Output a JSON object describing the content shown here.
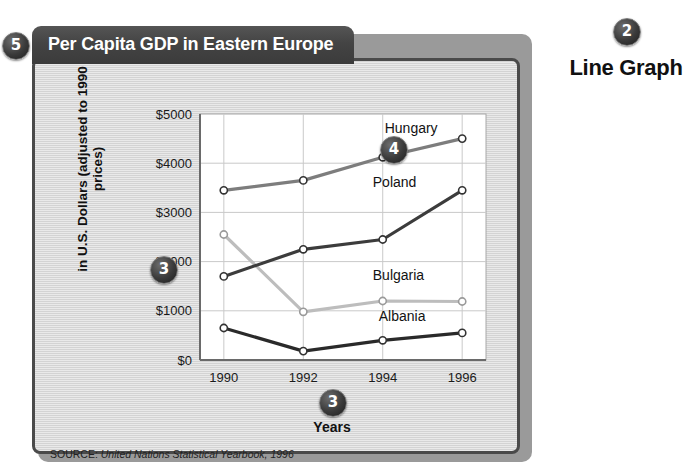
{
  "annotations": {
    "badge_5": "5",
    "badge_2": "2",
    "badge_4": "4",
    "badge_3a": "3",
    "badge_3b": "3"
  },
  "caption": {
    "line_graph": "Line Graph"
  },
  "card": {
    "title": "Per Capita GDP in Eastern Europe",
    "source_label": "SOURCE:",
    "source_reference": "United Nations Statistical Yearbook, 1996"
  },
  "chart_data": {
    "type": "line",
    "title": "Per Capita GDP in Eastern Europe",
    "xlabel": "Years",
    "ylabel": "in U.S. Dollars (adjusted to 1990 prices)",
    "x": [
      1990,
      1992,
      1994,
      1996
    ],
    "xtick_labels": [
      "1990",
      "1992",
      "1994",
      "1996"
    ],
    "ytick_labels": [
      "$0",
      "$1000",
      "$2000",
      "$3000",
      "$4000",
      "$5000"
    ],
    "yticks": [
      0,
      1000,
      2000,
      3000,
      4000,
      5000
    ],
    "ylim": [
      0,
      5000
    ],
    "xlim": [
      1989.4,
      1996.6
    ],
    "grid": true,
    "legend": "inline-labels",
    "markers": "open-circle",
    "series": [
      {
        "name": "Hungary",
        "color": "#7d7d7d",
        "values": [
          3450,
          3650,
          4120,
          4500
        ],
        "label_x": 1994.05,
        "label_y": 4620
      },
      {
        "name": "Poland",
        "color": "#3c3c3c",
        "values": [
          1700,
          2250,
          2450,
          3450
        ],
        "label_x": 1993.75,
        "label_y": 3520
      },
      {
        "name": "Bulgaria",
        "color": "#bdbdbd",
        "values": [
          2550,
          980,
          1200,
          1190
        ],
        "label_x": 1993.75,
        "label_y": 1620
      },
      {
        "name": "Albania",
        "color": "#2a2a2a",
        "values": [
          650,
          180,
          400,
          550
        ],
        "label_x": 1993.9,
        "label_y": 800
      }
    ]
  }
}
